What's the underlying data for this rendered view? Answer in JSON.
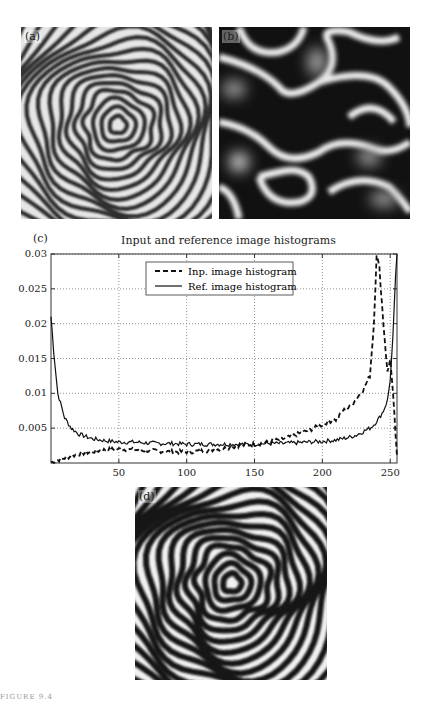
{
  "figure": {
    "panels": [
      {
        "id": "a",
        "label": "(a)",
        "description": "Input fringe pattern (concentric distorted rings)"
      },
      {
        "id": "b",
        "label": "(b)",
        "description": "Reference image (blob-like random pattern)"
      },
      {
        "id": "c",
        "label": "(c)"
      },
      {
        "id": "d",
        "label": "(d)",
        "description": "Histogram-matched fringe pattern (high contrast rings)"
      }
    ],
    "footer": "FIGURE 9.4"
  },
  "chart_data": {
    "type": "line",
    "title": "Input and reference image histograms",
    "xlabel": "",
    "ylabel": "",
    "xlim": [
      0,
      255
    ],
    "ylim": [
      0,
      0.03
    ],
    "xticks": [
      50,
      100,
      150,
      200,
      250
    ],
    "yticks": [
      0.005,
      0.01,
      0.015,
      0.02,
      0.025,
      0.03
    ],
    "ytick_labels": [
      "0.005",
      "0.01",
      "0.015",
      "0.02",
      "0.025",
      "0.03"
    ],
    "grid": true,
    "legend_position": "upper center",
    "x": [
      0,
      2,
      5,
      10,
      15,
      20,
      30,
      40,
      50,
      60,
      70,
      80,
      90,
      100,
      110,
      120,
      130,
      140,
      150,
      160,
      170,
      180,
      190,
      200,
      205,
      210,
      215,
      220,
      225,
      230,
      235,
      238,
      240,
      242,
      245,
      248,
      250,
      252,
      254,
      255
    ],
    "series": [
      {
        "name": "Inp. image histogram",
        "style": "dashed",
        "values": [
          0.0001,
          0.0002,
          0.0004,
          0.0007,
          0.001,
          0.0013,
          0.0016,
          0.0019,
          0.002,
          0.0019,
          0.0018,
          0.0017,
          0.0016,
          0.0016,
          0.0017,
          0.0019,
          0.0022,
          0.0025,
          0.0027,
          0.003,
          0.0034,
          0.004,
          0.0047,
          0.0055,
          0.006,
          0.0062,
          0.0075,
          0.008,
          0.0092,
          0.0105,
          0.0125,
          0.02,
          0.03,
          0.028,
          0.02,
          0.013,
          0.015,
          0.01,
          0.004,
          0.001
        ]
      },
      {
        "name": "Ref. image histogram",
        "style": "solid",
        "values": [
          0.021,
          0.016,
          0.01,
          0.0065,
          0.005,
          0.0042,
          0.0035,
          0.0032,
          0.003,
          0.003,
          0.0029,
          0.0028,
          0.0028,
          0.0027,
          0.0027,
          0.0027,
          0.0027,
          0.0027,
          0.0027,
          0.0028,
          0.0028,
          0.0029,
          0.003,
          0.0031,
          0.0032,
          0.0033,
          0.0035,
          0.0037,
          0.004,
          0.0045,
          0.005,
          0.0055,
          0.006,
          0.0065,
          0.0075,
          0.009,
          0.012,
          0.018,
          0.027,
          0.03
        ]
      }
    ]
  }
}
